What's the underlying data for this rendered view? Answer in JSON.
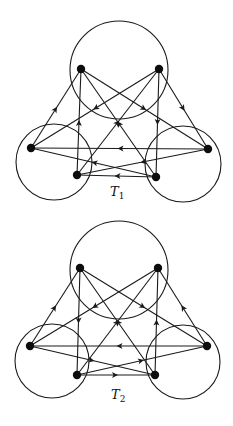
{
  "figure": {
    "colors": {
      "stroke": "#1a1a1a",
      "node": "#0d0d0d",
      "background": "#ffffff"
    },
    "graphs": [
      {
        "label": "T",
        "subscript": "1",
        "label_pos": [
          110,
          196
        ],
        "circles": [
          {
            "cx": 119,
            "cy": 70,
            "r": 49
          },
          {
            "cx": 54,
            "cy": 162,
            "r": 38
          },
          {
            "cx": 183,
            "cy": 164,
            "r": 38
          }
        ],
        "nodes": {
          "A": [
            81,
            69
          ],
          "B": [
            159,
            69
          ],
          "C": [
            31,
            148
          ],
          "D": [
            77,
            175
          ],
          "E": [
            156,
            177
          ],
          "F": [
            208,
            149
          ]
        },
        "edges": [
          {
            "from": "C",
            "to": "A"
          },
          {
            "from": "D",
            "to": "A"
          },
          {
            "from": "A",
            "to": "F"
          },
          {
            "from": "E",
            "to": "A"
          },
          {
            "from": "D",
            "to": "B"
          },
          {
            "from": "B",
            "to": "E"
          },
          {
            "from": "B",
            "to": "F"
          },
          {
            "from": "B",
            "to": "C"
          },
          {
            "from": "F",
            "to": "C"
          },
          {
            "from": "F",
            "to": "D"
          },
          {
            "from": "E",
            "to": "C"
          },
          {
            "from": "E",
            "to": "D"
          }
        ]
      },
      {
        "label": "T",
        "subscript": "2",
        "label_pos": [
          111,
          399
        ],
        "circles": [
          {
            "cx": 119,
            "cy": 270,
            "r": 49
          },
          {
            "cx": 52,
            "cy": 361,
            "r": 37
          },
          {
            "cx": 183,
            "cy": 362,
            "r": 37
          }
        ],
        "nodes": {
          "A": [
            80,
            268
          ],
          "B": [
            158,
            268
          ],
          "C": [
            30,
            346
          ],
          "D": [
            77,
            375
          ],
          "E": [
            155,
            375
          ],
          "F": [
            207,
            346
          ]
        },
        "edges": [
          {
            "from": "C",
            "to": "A"
          },
          {
            "from": "A",
            "to": "D"
          },
          {
            "from": "A",
            "to": "F"
          },
          {
            "from": "E",
            "to": "A"
          },
          {
            "from": "D",
            "to": "B"
          },
          {
            "from": "E",
            "to": "B"
          },
          {
            "from": "F",
            "to": "B"
          },
          {
            "from": "B",
            "to": "C"
          },
          {
            "from": "F",
            "to": "C"
          },
          {
            "from": "C",
            "to": "E"
          },
          {
            "from": "D",
            "to": "F"
          },
          {
            "from": "D",
            "to": "E"
          }
        ]
      }
    ]
  }
}
